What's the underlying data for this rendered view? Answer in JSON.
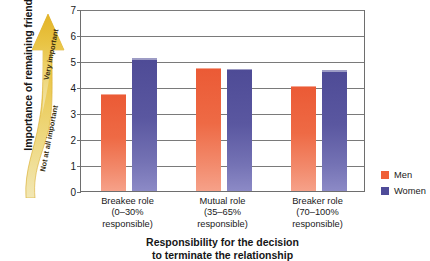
{
  "chart_data": {
    "type": "bar",
    "title": "",
    "xlabel_lines": [
      "Responsibility for the decision",
      "to terminate the relationship"
    ],
    "ylabel": "Importance of remaining friends",
    "ylim": [
      0,
      7
    ],
    "yticks": [
      0,
      1,
      2,
      3,
      4,
      5,
      6,
      7
    ],
    "grid": true,
    "legend_position": "right",
    "categories": [
      "Breakee role",
      "Mutual role",
      "Breaker role"
    ],
    "category_sublabels": [
      [
        "(0–30%",
        "responsible)"
      ],
      [
        "(35–65%",
        "responsible)"
      ],
      [
        "(70–100%",
        "responsible)"
      ]
    ],
    "series": [
      {
        "name": "Men",
        "color": "#ef5f36",
        "values": [
          3.75,
          4.75,
          4.05
        ]
      },
      {
        "name": "Women",
        "color": "#4f4c99",
        "values": [
          5.1,
          4.7,
          4.65
        ]
      }
    ]
  },
  "axes": {
    "y_title": "Importance of remaining friends",
    "y_tick_labels": [
      "7",
      "6",
      "5",
      "4",
      "3",
      "2",
      "1",
      "0"
    ],
    "x_title_line1": "Responsibility for the decision",
    "x_title_line2": "to terminate the relationship",
    "x_ticks": [
      {
        "line1": "Breakee role",
        "line2": "(0–30%",
        "line3": "responsible)"
      },
      {
        "line1": "Mutual role",
        "line2": "(35–65%",
        "line3": "responsible)"
      },
      {
        "line1": "Breaker role",
        "line2": "(70–100%",
        "line3": "responsible)"
      }
    ]
  },
  "arrow": {
    "top_label": "Very important",
    "bottom_label": "Not at all important",
    "color": "#e8c24a"
  },
  "legend": {
    "items": [
      {
        "label": "Men",
        "color": "#ef5f36"
      },
      {
        "label": "Women",
        "color": "#4f4c99"
      }
    ]
  }
}
